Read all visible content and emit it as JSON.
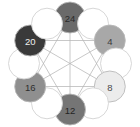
{
  "figure": {
    "type": "node-ring-diagram",
    "width": 140,
    "height": 127,
    "background": "#ffffff",
    "center": {
      "x": 70,
      "y": 63.5
    },
    "ring_radius": 46,
    "node_radius": 15.5,
    "node_count": 12,
    "labeled_node_count": 6,
    "empty_node_count": 6
  },
  "style": {
    "edge_color": "#b6b6b6",
    "edge_width": 0.75,
    "node_stroke": "#b9b9b9",
    "empty_node_fill": "#ffffff",
    "empty_node_stroke": "#d2d2d2",
    "label_font_size": 9.5
  },
  "nodes": [
    {
      "id": "node-24",
      "label": "24",
      "slot": 0,
      "angle_deg": 270,
      "cx": 70,
      "cy": 17.5,
      "r": 15.5,
      "fill": "#6a6a6a",
      "text_color": "#2a2a2a",
      "empty": false
    },
    {
      "id": "node-empty-1",
      "label": "",
      "slot": 1,
      "angle_deg": 300,
      "cx": 93,
      "cy": 23.7,
      "r": 15.5,
      "fill": "#ffffff",
      "text_color": "#ffffff",
      "empty": true
    },
    {
      "id": "node-4",
      "label": "4",
      "slot": 2,
      "angle_deg": 330,
      "cx": 109.8,
      "cy": 40.5,
      "r": 15.5,
      "fill": "#a8a8a8",
      "text_color": "#3a3a3a",
      "empty": false
    },
    {
      "id": "node-empty-3",
      "label": "",
      "slot": 3,
      "angle_deg": 0,
      "cx": 116,
      "cy": 63.5,
      "r": 15.5,
      "fill": "#ffffff",
      "text_color": "#ffffff",
      "empty": true
    },
    {
      "id": "node-8",
      "label": "8",
      "slot": 4,
      "angle_deg": 30,
      "cx": 109.8,
      "cy": 86.5,
      "r": 15.5,
      "fill": "#ececec",
      "text_color": "#4a4a4a",
      "empty": false
    },
    {
      "id": "node-empty-5",
      "label": "",
      "slot": 5,
      "angle_deg": 60,
      "cx": 93,
      "cy": 103.3,
      "r": 15.5,
      "fill": "#ffffff",
      "text_color": "#ffffff",
      "empty": true
    },
    {
      "id": "node-12",
      "label": "12",
      "slot": 6,
      "angle_deg": 90,
      "cx": 70,
      "cy": 109.5,
      "r": 15.5,
      "fill": "#757575",
      "text_color": "#242424",
      "empty": false
    },
    {
      "id": "node-empty-7",
      "label": "",
      "slot": 7,
      "angle_deg": 120,
      "cx": 47,
      "cy": 103.3,
      "r": 15.5,
      "fill": "#ffffff",
      "text_color": "#ffffff",
      "empty": true
    },
    {
      "id": "node-16",
      "label": "16",
      "slot": 8,
      "angle_deg": 150,
      "cx": 30.2,
      "cy": 86.5,
      "r": 15.5,
      "fill": "#8f8f8f",
      "text_color": "#2e2e2e",
      "empty": false
    },
    {
      "id": "node-empty-9",
      "label": "",
      "slot": 9,
      "angle_deg": 180,
      "cx": 24,
      "cy": 63.5,
      "r": 15.5,
      "fill": "#ffffff",
      "text_color": "#ffffff",
      "empty": true
    },
    {
      "id": "node-20",
      "label": "20",
      "slot": 10,
      "angle_deg": 210,
      "cx": 30.2,
      "cy": 40.5,
      "r": 15.5,
      "fill": "#3a3a3a",
      "text_color": "#f0f0f0",
      "empty": false
    },
    {
      "id": "node-empty-11",
      "label": "",
      "slot": 11,
      "angle_deg": 240,
      "cx": 47,
      "cy": 23.7,
      "r": 15.5,
      "fill": "#ffffff",
      "text_color": "#ffffff",
      "empty": true
    }
  ],
  "edges": [
    {
      "id": "edge-24-12",
      "from": "node-24",
      "to": "node-12",
      "kind": "diameter"
    },
    {
      "id": "edge-4-16",
      "from": "node-4",
      "to": "node-16",
      "kind": "diameter"
    },
    {
      "id": "edge-8-20",
      "from": "node-8",
      "to": "node-20",
      "kind": "diameter"
    },
    {
      "id": "edge-24-8",
      "from": "node-24",
      "to": "node-8",
      "kind": "chord"
    },
    {
      "id": "edge-8-16",
      "from": "node-8",
      "to": "node-16",
      "kind": "chord"
    },
    {
      "id": "edge-16-24",
      "from": "node-16",
      "to": "node-24",
      "kind": "chord"
    },
    {
      "id": "edge-4-12",
      "from": "node-4",
      "to": "node-12",
      "kind": "chord"
    },
    {
      "id": "edge-12-20",
      "from": "node-12",
      "to": "node-20",
      "kind": "chord"
    },
    {
      "id": "edge-20-4",
      "from": "node-20",
      "to": "node-4",
      "kind": "chord"
    }
  ],
  "labels": {
    "values": [
      "24",
      "4",
      "8",
      "12",
      "16",
      "20"
    ]
  }
}
